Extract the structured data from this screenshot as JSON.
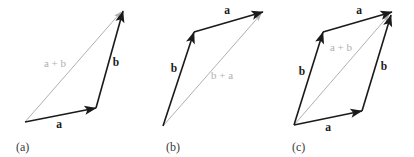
{
  "figure": {
    "background_color": "#ffffff",
    "dark_color": "#1a1a1a",
    "gray_color": "#b0b0b0",
    "caption_color": "#3a3a3a",
    "width": 414,
    "height": 157
  },
  "panels": [
    {
      "id": "a",
      "caption": "(a)",
      "caption_x": 16,
      "caption_y": 151,
      "arrows": [
        {
          "name": "vector-a",
          "label": "a",
          "style": "dark",
          "x1": 25,
          "y1": 122,
          "x2": 96,
          "y2": 108,
          "label_x": 59,
          "label_y": 128
        },
        {
          "name": "vector-b",
          "label": "b",
          "style": "dark",
          "x1": 96,
          "y1": 108,
          "x2": 123,
          "y2": 11,
          "label_x": 116,
          "label_y": 66
        },
        {
          "name": "vector-a-plus-b",
          "label": "a + b",
          "style": "gray",
          "x1": 25,
          "y1": 122,
          "x2": 121,
          "y2": 12,
          "label_x": 55,
          "label_y": 67
        }
      ]
    },
    {
      "id": "b",
      "caption": "(b)",
      "caption_x": 166,
      "caption_y": 151,
      "arrows": [
        {
          "name": "vector-b",
          "label": "b",
          "style": "dark",
          "x1": 163,
          "y1": 126,
          "x2": 194,
          "y2": 32,
          "label_x": 174,
          "label_y": 72
        },
        {
          "name": "vector-a",
          "label": "a",
          "style": "dark",
          "x1": 194,
          "y1": 32,
          "x2": 263,
          "y2": 12,
          "label_x": 227,
          "label_y": 14
        },
        {
          "name": "vector-b-plus-a",
          "label": "b + a",
          "style": "gray",
          "x1": 163,
          "y1": 126,
          "x2": 261,
          "y2": 14,
          "label_x": 222,
          "label_y": 79
        }
      ]
    },
    {
      "id": "c",
      "caption": "(c)",
      "caption_x": 292,
      "caption_y": 151,
      "arrows": [
        {
          "name": "vector-b-left",
          "label": "b",
          "style": "dark",
          "x1": 294,
          "y1": 125,
          "x2": 323,
          "y2": 32,
          "label_x": 302,
          "label_y": 75
        },
        {
          "name": "vector-a-top",
          "label": "a",
          "style": "dark",
          "x1": 323,
          "y1": 32,
          "x2": 392,
          "y2": 12,
          "label_x": 359,
          "label_y": 14
        },
        {
          "name": "vector-a-bottom",
          "label": "a",
          "style": "dark",
          "x1": 294,
          "y1": 125,
          "x2": 362,
          "y2": 111,
          "label_x": 328,
          "label_y": 131
        },
        {
          "name": "vector-b-right",
          "label": "b",
          "style": "dark",
          "x1": 362,
          "y1": 111,
          "x2": 391,
          "y2": 15,
          "label_x": 384,
          "label_y": 70
        },
        {
          "name": "vector-a-plus-b",
          "label": "a + b",
          "style": "gray",
          "x1": 294,
          "y1": 125,
          "x2": 389,
          "y2": 15,
          "label_x": 341,
          "label_y": 51
        }
      ]
    }
  ]
}
